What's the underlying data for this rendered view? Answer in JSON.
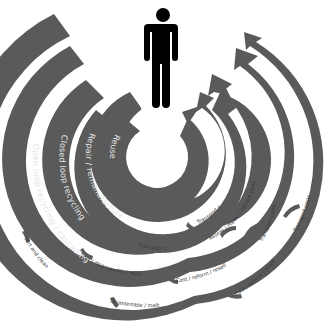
{
  "diagram": {
    "center_icon": "person-icon",
    "colors": {
      "ring": "#5a5a5a",
      "inner_text": "#e6e6e6",
      "outer_text": "#3a3a3a",
      "person": "#000000",
      "background": "#ffffff"
    },
    "loops": [
      {
        "id": "reuse",
        "label": "Reuse",
        "steps": [
          "Transport costs"
        ]
      },
      {
        "id": "repair",
        "label": "Repair / remanufacture",
        "steps": [
          "Transport costs",
          "Assess / repair / replace parts"
        ]
      },
      {
        "id": "closed-loop",
        "label": "Closed loop recycling",
        "steps": [
          "Sort / disassemble / melt",
          "Cast / reform / resell",
          "Transport costs"
        ]
      },
      {
        "id": "open-loop",
        "label": "Open loop recycling / cascading",
        "steps": [
          "Sort and clean",
          "Disassemble / melt",
          "Cast / reform / resell",
          "Transport costs"
        ]
      }
    ]
  }
}
